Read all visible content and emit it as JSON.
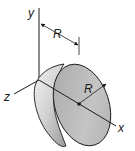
{
  "figure": {
    "type": "hemisphere-diagram",
    "axes": {
      "x_label": "x",
      "y_label": "y",
      "z_label": "z"
    },
    "dimensions": {
      "offset_label": "R",
      "radius_label": "R"
    },
    "colors": {
      "body_light": "#e6e6e6",
      "body_dark": "#9a9a9a",
      "face": "#b5b5b5",
      "stroke": "#1a1a1a"
    }
  }
}
